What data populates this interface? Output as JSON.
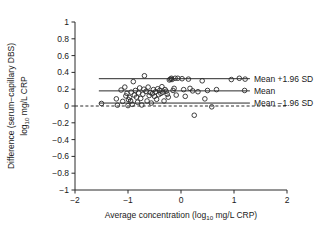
{
  "chart_data": {
    "type": "scatter",
    "title": "",
    "xlabel": "Average concentration (log10 mg/L CRP)",
    "xlabel_main": "Average concentration (log",
    "xlabel_sub": "10",
    "xlabel_tail": " mg/L CRP)",
    "ylabel_line1": "Difference (serum−capillary DBS)",
    "ylabel_line2_main": "log",
    "ylabel_line2_sub": "10",
    "ylabel_line2_tail": " mg/L CRP",
    "xlim": [
      -2,
      2
    ],
    "ylim": [
      -1,
      1
    ],
    "xticks": [
      -2,
      -1,
      0,
      1,
      2
    ],
    "xtick_labels": [
      "−2",
      "−1",
      "0",
      "1",
      "2"
    ],
    "yticks": [
      1,
      0.8,
      0.6,
      0.4,
      0.2,
      0,
      -0.2,
      -0.4,
      -0.6,
      -0.8,
      -1
    ],
    "ytick_labels": [
      "1",
      "0.8",
      "0.6",
      "0.4",
      "0.2",
      "0",
      "−0.2",
      "−0.4",
      "−0.6",
      "−0.8",
      "−1"
    ],
    "grid": false,
    "legend_position": "right-inline",
    "marker_style": "open-circle",
    "marker_color": "#2b2b2b",
    "reference_lines": [
      {
        "id": "upper-loa",
        "label": "Mean +1.96 SD",
        "y": 0.325,
        "style": "solid",
        "x_start": -1.55,
        "x_end": 1.3
      },
      {
        "id": "mean",
        "label": "Mean",
        "y": 0.18,
        "style": "solid",
        "x_start": -1.55,
        "x_end": 1.3
      },
      {
        "id": "lower-loa",
        "label": "Mean −1.96 SD",
        "y": 0.035,
        "style": "solid",
        "x_start": -1.55,
        "x_end": 1.3
      }
    ],
    "zero_line": {
      "id": "zero-line",
      "y": 0,
      "style": "dashed",
      "x_start": -2,
      "x_end": 2
    },
    "points": [
      [
        -1.5,
        0.03
      ],
      [
        -1.22,
        0.085
      ],
      [
        -1.2,
        0.01
      ],
      [
        -1.13,
        0.19
      ],
      [
        -1.1,
        0.055
      ],
      [
        -1.06,
        0.225
      ],
      [
        -1.04,
        0.12
      ],
      [
        -1.02,
        0.15
      ],
      [
        -1.0,
        0.005
      ],
      [
        -0.99,
        0.075
      ],
      [
        -0.97,
        0.1
      ],
      [
        -0.95,
        0.06
      ],
      [
        -0.94,
        0.165
      ],
      [
        -0.92,
        0.02
      ],
      [
        -0.9,
        0.29
      ],
      [
        -0.88,
        0.13
      ],
      [
        -0.86,
        0.185
      ],
      [
        -0.84,
        0.105
      ],
      [
        -0.82,
        0.045
      ],
      [
        -0.8,
        0.155
      ],
      [
        -0.78,
        0.215
      ],
      [
        -0.76,
        0.09
      ],
      [
        -0.74,
        0.012
      ],
      [
        -0.72,
        0.14
      ],
      [
        -0.7,
        0.2
      ],
      [
        -0.69,
        0.36
      ],
      [
        -0.66,
        0.175
      ],
      [
        -0.64,
        0.06
      ],
      [
        -0.62,
        0.225
      ],
      [
        -0.6,
        0.125
      ],
      [
        -0.58,
        0.16
      ],
      [
        -0.56,
        0.035
      ],
      [
        -0.54,
        0.145
      ],
      [
        -0.52,
        0.195
      ],
      [
        -0.5,
        0.115
      ],
      [
        -0.48,
        0.17
      ],
      [
        -0.46,
        0.08
      ],
      [
        -0.44,
        0.205
      ],
      [
        -0.42,
        0.135
      ],
      [
        -0.4,
        0.185
      ],
      [
        -0.38,
        0.15
      ],
      [
        -0.36,
        0.23
      ],
      [
        -0.34,
        0.165
      ],
      [
        -0.32,
        0.06
      ],
      [
        -0.3,
        0.195
      ],
      [
        -0.28,
        0.175
      ],
      [
        -0.26,
        0.14
      ],
      [
        -0.24,
        0.105
      ],
      [
        -0.22,
        0.31
      ],
      [
        -0.2,
        0.32
      ],
      [
        -0.18,
        0.33
      ],
      [
        -0.17,
        0.315
      ],
      [
        -0.15,
        0.185
      ],
      [
        -0.13,
        0.21
      ],
      [
        -0.11,
        0.33
      ],
      [
        -0.09,
        0.13
      ],
      [
        -0.06,
        0.33
      ],
      [
        0.02,
        0.325
      ],
      [
        0.05,
        0.195
      ],
      [
        0.08,
        0.115
      ],
      [
        0.14,
        0.32
      ],
      [
        0.17,
        0.21
      ],
      [
        0.22,
        0.18
      ],
      [
        0.25,
        -0.11
      ],
      [
        0.32,
        0.17
      ],
      [
        0.4,
        0.3
      ],
      [
        0.45,
        0.085
      ],
      [
        0.5,
        0.185
      ],
      [
        0.58,
        -0.01
      ],
      [
        0.67,
        0.195
      ],
      [
        0.95,
        0.315
      ],
      [
        1.1,
        0.33
      ],
      [
        1.2,
        0.185
      ],
      [
        1.21,
        0.32
      ]
    ]
  }
}
